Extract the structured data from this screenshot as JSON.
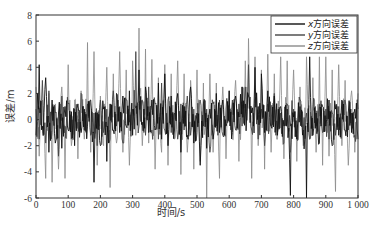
{
  "chart_data": {
    "type": "line",
    "title": "",
    "xlabel": "时间/s",
    "ylabel": "误差/m",
    "xlim": [
      0,
      1000
    ],
    "ylim": [
      -6,
      8
    ],
    "xticks": [
      0,
      100,
      200,
      300,
      400,
      500,
      600,
      700,
      800,
      900,
      1000
    ],
    "xtick_labels": [
      "0",
      "100",
      "200",
      "300",
      "400",
      "500",
      "600",
      "700",
      "800",
      "900",
      "1 000"
    ],
    "yticks": [
      -6,
      -4,
      -2,
      0,
      2,
      4,
      6,
      8
    ],
    "ytick_labels": [
      "-6",
      "-4",
      "-2",
      "0",
      "2",
      "4",
      "6",
      "8"
    ],
    "grid": false,
    "legend_position": "upper right",
    "x": [
      0,
      10,
      20,
      30,
      40,
      50,
      60,
      70,
      80,
      90,
      100,
      110,
      120,
      130,
      140,
      150,
      160,
      170,
      180,
      190,
      200,
      210,
      220,
      230,
      240,
      250,
      260,
      270,
      280,
      290,
      300,
      310,
      320,
      330,
      340,
      350,
      360,
      370,
      380,
      390,
      400,
      410,
      420,
      430,
      440,
      450,
      460,
      470,
      480,
      490,
      500,
      510,
      520,
      530,
      540,
      550,
      560,
      570,
      580,
      590,
      600,
      610,
      620,
      630,
      640,
      650,
      660,
      670,
      680,
      690,
      700,
      710,
      720,
      730,
      740,
      750,
      760,
      770,
      780,
      790,
      800,
      810,
      820,
      830,
      840,
      850,
      860,
      870,
      880,
      890,
      900,
      910,
      920,
      930,
      940,
      950,
      960,
      970,
      980,
      990,
      1000
    ],
    "series": [
      {
        "name": "x方向误差",
        "color": "#111111",
        "values": [
          -1.2,
          4.2,
          -0.5,
          3.2,
          -2.5,
          1.5,
          -1.8,
          0.5,
          -2.2,
          1.0,
          -0.8,
          0.6,
          -2.0,
          1.2,
          -1.0,
          0.8,
          -0.5,
          1.5,
          -4.8,
          0.5,
          -2.0,
          0.8,
          -3.2,
          1.2,
          -0.8,
          2.0,
          -1.0,
          1.8,
          -0.5,
          2.2,
          -1.2,
          1.0,
          3.8,
          -0.2,
          2.5,
          -1.0,
          1.5,
          -0.8,
          2.8,
          -1.5,
          3.5,
          -2.0,
          1.8,
          -0.8,
          2.0,
          -2.5,
          1.0,
          -1.2,
          2.5,
          -1.8,
          0.5,
          -3.5,
          1.2,
          -2.2,
          0.8,
          -1.5,
          2.0,
          -1.0,
          1.5,
          -0.5,
          2.2,
          -1.0,
          1.8,
          0.2,
          2.5,
          1.2,
          1.8,
          0.5,
          4.0,
          1.0,
          3.5,
          -1.0,
          2.2,
          -0.5,
          1.8,
          -1.2,
          1.0,
          -0.5,
          0.8,
          -5.8,
          0.2,
          -1.5,
          1.0,
          -0.8,
          -6.0,
          4.8,
          -1.2,
          0.5,
          -1.8,
          1.0,
          -0.5,
          1.5,
          -2.0,
          0.8,
          -1.2,
          1.5,
          -0.8,
          0.5,
          -1.0,
          0.8,
          -1.5
        ]
      },
      {
        "name": "y方向误差",
        "color": "#444444",
        "values": [
          0.8,
          -1.5,
          3.0,
          -1.8,
          2.2,
          -1.0,
          0.5,
          -2.8,
          1.8,
          -0.5,
          1.2,
          -1.5,
          0.8,
          -0.2,
          2.0,
          -0.8,
          1.2,
          -1.2,
          0.5,
          -2.0,
          1.5,
          -1.0,
          0.8,
          -1.5,
          2.2,
          -0.5,
          1.0,
          -1.8,
          1.5,
          -0.2,
          0.8,
          5.2,
          -0.5,
          1.5,
          -1.2,
          2.5,
          -0.8,
          1.2,
          -1.5,
          2.8,
          -0.8,
          1.5,
          -1.0,
          0.5,
          -1.5,
          1.2,
          -0.8,
          1.8,
          -1.2,
          0.8,
          -1.0,
          1.5,
          -0.5,
          0.8,
          -2.5,
          1.2,
          -0.5,
          1.5,
          -1.2,
          0.8,
          -0.2,
          1.5,
          -0.8,
          1.2,
          -0.5,
          2.5,
          4.2,
          -0.8,
          1.5,
          -1.5,
          0.8,
          -2.0,
          1.2,
          -0.5,
          2.0,
          -1.0,
          0.5,
          -1.8,
          1.2,
          -0.5,
          0.8,
          -1.2,
          1.5,
          -0.8,
          0.5,
          -1.5,
          1.0,
          -0.5,
          1.2,
          -1.0,
          0.8,
          -1.5,
          0.5,
          -1.2,
          1.0,
          -0.5,
          1.5,
          -0.8,
          0.5,
          -1.2,
          0.8
        ]
      },
      {
        "name": "z方向误差",
        "color": "#8a8a8a",
        "values": [
          2.5,
          -2.8,
          1.5,
          -4.5,
          2.0,
          -4.8,
          1.2,
          -3.8,
          2.5,
          -4.5,
          4.2,
          -2.0,
          1.5,
          -3.0,
          2.2,
          -1.5,
          5.9,
          -2.5,
          5.2,
          -3.5,
          1.8,
          -2.0,
          4.0,
          -5.2,
          3.5,
          -1.8,
          5.2,
          -2.5,
          3.8,
          -3.5,
          4.5,
          -1.2,
          7.0,
          -2.0,
          5.4,
          -1.8,
          4.6,
          -3.8,
          3.2,
          -2.5,
          4.2,
          -3.5,
          3.5,
          -1.5,
          4.5,
          -4.2,
          3.5,
          -2.5,
          3.0,
          -3.8,
          3.8,
          -3.2,
          2.8,
          -6.0,
          3.5,
          -2.5,
          2.8,
          -4.5,
          2.5,
          -3.0,
          2.2,
          -1.5,
          3.0,
          -3.2,
          2.5,
          4.5,
          6.2,
          -4.5,
          4.8,
          -2.0,
          3.8,
          -3.8,
          5.0,
          -2.5,
          3.5,
          -1.5,
          4.8,
          -3.0,
          4.5,
          -2.5,
          3.8,
          -3.2,
          2.5,
          -2.0,
          4.8,
          -1.5,
          3.2,
          -2.5,
          4.8,
          -3.5,
          4.8,
          -2.8,
          3.8,
          -5.5,
          4.2,
          -2.0,
          3.0,
          -3.5,
          2.2,
          -2.5,
          2.0
        ]
      }
    ]
  },
  "legend": {
    "items": [
      {
        "label_var": "x",
        "label_text": "方向误差",
        "color": "#111111"
      },
      {
        "label_var": "y",
        "label_text": "方向误差",
        "color": "#444444"
      },
      {
        "label_var": "z",
        "label_text": "方向误差",
        "color": "#8a8a8a"
      }
    ]
  },
  "axes": {
    "xlabel": "时间/s",
    "ylabel": "误差/m"
  }
}
